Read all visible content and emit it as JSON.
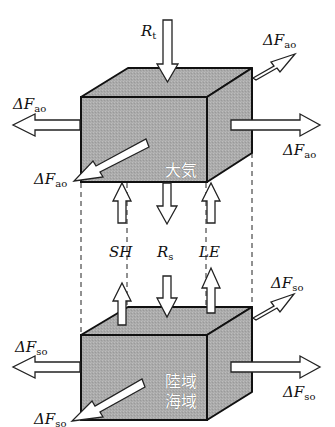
{
  "diagram": {
    "title": "",
    "colors": {
      "box_face": "#a9a9a9",
      "box_top": "#b8b8b8",
      "box_side": "#9d9d9d",
      "outline": "#111111",
      "arrow_fill": "#ffffff"
    },
    "boxes": {
      "atmosphere": {
        "label": "大気"
      },
      "surface": {
        "label_line1": "陸域",
        "label_line2": "海域"
      }
    },
    "labels": {
      "toa_radiation": {
        "symbol": "R",
        "sub": "t"
      },
      "surface_radiation": {
        "symbol": "R",
        "sub": "s"
      },
      "sensible_heat": {
        "symbol": "SH"
      },
      "latent_heat": {
        "symbol": "LE"
      },
      "atm_flux": {
        "symbol": "ΔF",
        "sub": "ao"
      },
      "surf_flux": {
        "symbol": "ΔF",
        "sub": "so"
      }
    },
    "flux_arrows": {
      "atmosphere": [
        "ΔFao back-right",
        "ΔFao left",
        "ΔFao right",
        "ΔFao front-left"
      ],
      "surface": [
        "ΔFso back-right",
        "ΔFso left",
        "ΔFso right",
        "ΔFso front-left"
      ],
      "vertical": [
        "Rt down",
        "SH up",
        "Rs down",
        "LE up"
      ]
    }
  }
}
